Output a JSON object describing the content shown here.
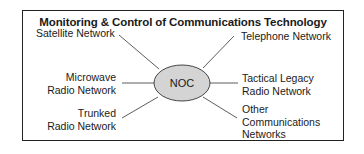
{
  "diagram": {
    "title": "Monitoring & Control of Communications Technology",
    "center": {
      "label": "NOC",
      "fill": "#d4d4d4"
    },
    "left_nodes": [
      {
        "label": "Satellite Network"
      },
      {
        "label_line1": "Microwave",
        "label_line2": "Radio Network"
      },
      {
        "label_line1": "Trunked",
        "label_line2": "Radio Network"
      }
    ],
    "right_nodes": [
      {
        "label": "Telephone Network"
      },
      {
        "label_line1": "Tactical Legacy",
        "label_line2": "Radio Network"
      },
      {
        "label_line1": "Other",
        "label_line2": "Communications",
        "label_line3": "Networks"
      }
    ]
  }
}
